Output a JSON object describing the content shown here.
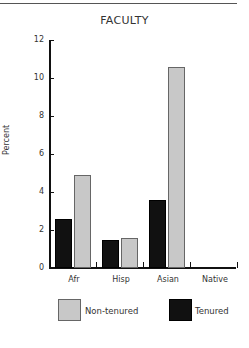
{
  "chart_data": {
    "type": "bar",
    "title": "FACULTY",
    "xlabel": "",
    "ylabel": "Percent",
    "ylim": [
      0,
      12
    ],
    "yticks": [
      0,
      2,
      4,
      6,
      8,
      10,
      12
    ],
    "categories": [
      "Afr",
      "Hisp",
      "Asian",
      "Native"
    ],
    "series": [
      {
        "name": "Tenured",
        "color": "#111111",
        "values": [
          2.6,
          1.5,
          3.6,
          0
        ]
      },
      {
        "name": "Non-tenured",
        "color": "#c8c8c8",
        "values": [
          4.9,
          1.6,
          10.6,
          0
        ]
      }
    ],
    "legend": [
      "Non-tenured",
      "Tenured"
    ],
    "legend_position": "bottom",
    "grid": false
  }
}
